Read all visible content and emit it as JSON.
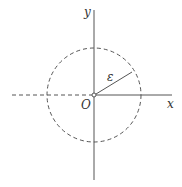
{
  "diagram": {
    "labels": {
      "y_axis": "y",
      "x_axis": "x",
      "origin": "O",
      "radius": "ε"
    },
    "colors": {
      "stroke": "#555555",
      "text": "#333333",
      "background": "#ffffff"
    },
    "geometry": {
      "origin": [
        94,
        95
      ],
      "circle_radius": 47,
      "radius_endpoint": [
        132,
        72
      ]
    }
  }
}
